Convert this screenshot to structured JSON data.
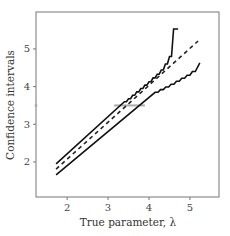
{
  "chart_data": {
    "type": "line",
    "title": "",
    "xlabel": "True parameter, λ",
    "ylabel": "Confidence intervals",
    "xlim": [
      1.24,
      5.71
    ],
    "ylim": [
      1.07,
      5.98
    ],
    "xticks": [
      2,
      3,
      4,
      5
    ],
    "yticks": [
      2,
      3,
      4,
      5
    ],
    "grid": false,
    "legend": null,
    "series": [
      {
        "name": "upper-bound",
        "style": "solid",
        "color": "#111111",
        "x": [
          1.73,
          3.4,
          3.45,
          3.5,
          3.55,
          3.6,
          3.65,
          3.7,
          3.75,
          3.8,
          3.85,
          3.9,
          3.95,
          4.0,
          4.05,
          4.1,
          4.15,
          4.2,
          4.25,
          4.3,
          4.35,
          4.4,
          4.45,
          4.5,
          4.55,
          4.6,
          4.71
        ],
        "y": [
          1.95,
          3.6,
          3.6,
          3.68,
          3.68,
          3.77,
          3.77,
          3.86,
          3.86,
          3.95,
          3.95,
          4.04,
          4.04,
          4.13,
          4.13,
          4.23,
          4.23,
          4.33,
          4.33,
          4.44,
          4.44,
          4.6,
          4.6,
          4.8,
          4.8,
          5.53,
          5.53
        ]
      },
      {
        "name": "point-estimate",
        "style": "dashed",
        "color": "#222222",
        "x": [
          1.73,
          5.2
        ],
        "y": [
          1.81,
          5.21
        ]
      },
      {
        "name": "lower-bound",
        "style": "solid",
        "color": "#111111",
        "x": [
          1.73,
          4.15,
          4.22,
          4.28,
          4.35,
          4.41,
          4.48,
          4.54,
          4.61,
          4.67,
          4.74,
          4.8,
          4.87,
          4.93,
          5.0,
          5.06,
          5.13,
          5.24
        ],
        "y": [
          1.66,
          3.85,
          3.85,
          3.92,
          3.92,
          3.99,
          3.99,
          4.06,
          4.06,
          4.14,
          4.14,
          4.22,
          4.22,
          4.3,
          4.3,
          4.4,
          4.4,
          4.63
        ]
      }
    ],
    "annotations": [
      {
        "type": "hline-segment",
        "y": 3.5,
        "x0": 3.15,
        "x1": 3.9,
        "color": "#aaaaaa"
      },
      {
        "type": "axis-marker",
        "axis": "y",
        "y": 3.5,
        "color": "#aaaaaa"
      }
    ]
  }
}
